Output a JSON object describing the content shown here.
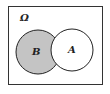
{
  "diagram": {
    "type": "venn",
    "universe_label": "Ω",
    "sets": [
      {
        "id": "B",
        "label": "B",
        "shaded": true
      },
      {
        "id": "A",
        "label": "A",
        "shaded": false
      }
    ],
    "colors": {
      "shade": "#c4c4c4",
      "stroke": "#222222",
      "background": "#ffffff"
    }
  }
}
